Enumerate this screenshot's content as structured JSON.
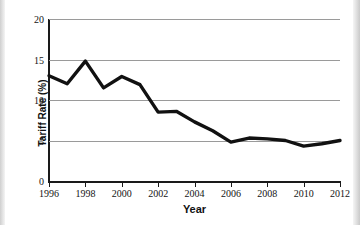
{
  "chart_data": {
    "type": "line",
    "title": "",
    "xlabel": "Year",
    "ylabel": "Tariff Rate (%)",
    "xlim": [
      1996,
      2012
    ],
    "ylim": [
      0,
      20
    ],
    "grid": true,
    "legend": false,
    "line_color": "#111111",
    "x_tick_labels": [
      "1996",
      "1998",
      "2000",
      "2002",
      "2004",
      "2006",
      "2008",
      "2010",
      "2012"
    ],
    "x_ticks": [
      1996,
      1998,
      2000,
      2002,
      2004,
      2006,
      2008,
      2010,
      2012
    ],
    "y_tick_labels": [
      "0",
      "5",
      "10",
      "15",
      "20"
    ],
    "y_ticks": [
      0,
      5,
      10,
      15,
      20
    ],
    "series": [
      {
        "name": "Tariff Rate",
        "x": [
          1996,
          1997,
          1998,
          1999,
          2000,
          2001,
          2002,
          2003,
          2004,
          2005,
          2006,
          2007,
          2008,
          2009,
          2010,
          2011,
          2012
        ],
        "values": [
          13.0,
          12.0,
          14.8,
          11.5,
          12.9,
          11.9,
          8.5,
          8.6,
          7.3,
          6.2,
          4.8,
          5.3,
          5.2,
          5.0,
          4.3,
          4.6,
          5.0
        ]
      }
    ]
  }
}
